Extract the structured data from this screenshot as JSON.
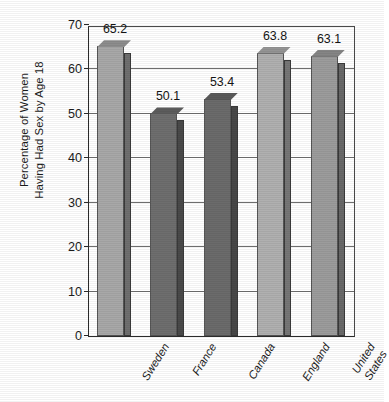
{
  "chart_data": {
    "type": "bar",
    "title": "",
    "xlabel": "",
    "ylabel": "Percentage of Women Having Had Sex by Age 18",
    "ylabel_line1": "Percentage of Women",
    "ylabel_line2": "Having Had Sex by Age 18",
    "categories": [
      "Sweden",
      "France",
      "Canada",
      "England",
      "United States"
    ],
    "category_lines": [
      [
        "Sweden"
      ],
      [
        "France"
      ],
      [
        "Canada"
      ],
      [
        "England"
      ],
      [
        "United",
        "States"
      ]
    ],
    "values": [
      65.2,
      50.1,
      53.4,
      63.8,
      63.1
    ],
    "value_labels": [
      "65.2",
      "50.1",
      "53.4",
      "63.8",
      "63.1"
    ],
    "ylim": [
      0,
      70
    ],
    "ytick_values": [
      0,
      10,
      20,
      30,
      40,
      50,
      60,
      70
    ],
    "ytick_labels": [
      "0",
      "10",
      "20",
      "30",
      "40",
      "50",
      "60",
      "70"
    ],
    "grid": true,
    "grid_axis": "y",
    "legend": false,
    "legend_position": "none",
    "bar_style": "3d",
    "bar_colors": [
      "#a8a8a8",
      "#6e6e6e",
      "#6b6b6b",
      "#b0b0b0",
      "#9c9c9c"
    ],
    "bar_side_colors": [
      "#6f6f6f",
      "#4a4a4a",
      "#474747",
      "#767676",
      "#696969"
    ],
    "bar_top_colors": [
      "#8d8d8d",
      "#5c5c5c",
      "#5a5a5a",
      "#949494",
      "#858585"
    ]
  },
  "colors": {
    "background": "#ffffff",
    "axis": "#2b2b2b",
    "grid": "#6e6e6e",
    "text": "#1a1a1a"
  }
}
